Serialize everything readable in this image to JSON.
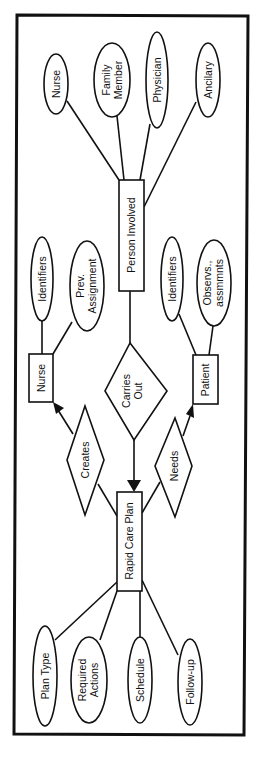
{
  "diagram": {
    "type": "entity-relationship",
    "orientation": "rotated-90-ccw",
    "colors": {
      "ink": "#111111",
      "background": "#ffffff"
    },
    "entities": [
      {
        "id": "person_involved",
        "label": "Person Involved"
      },
      {
        "id": "nurse",
        "label": "Nurse"
      },
      {
        "id": "patient",
        "label": "Patient"
      },
      {
        "id": "rapid_care_plan",
        "label": "Rapid Care Plan"
      }
    ],
    "relationships": [
      {
        "id": "carries_out",
        "lines": [
          "Carries",
          "Out"
        ],
        "from": "person_involved",
        "to": "rapid_care_plan"
      },
      {
        "id": "creates",
        "lines": [
          "Creates"
        ],
        "from": "rapid_care_plan",
        "to": "nurse"
      },
      {
        "id": "needs",
        "lines": [
          "Needs"
        ],
        "from": "rapid_care_plan",
        "to": "patient"
      }
    ],
    "attributes": {
      "person_involved": [
        {
          "id": "pi_nurse",
          "lines": [
            "Nurse"
          ]
        },
        {
          "id": "pi_family",
          "lines": [
            "Family",
            "Member"
          ]
        },
        {
          "id": "pi_physician",
          "lines": [
            "Physician"
          ]
        },
        {
          "id": "pi_ancilary",
          "lines": [
            "Ancilary"
          ]
        }
      ],
      "nurse": [
        {
          "id": "n_identifiers",
          "lines": [
            "Identifiers"
          ]
        },
        {
          "id": "n_prev",
          "lines": [
            "Prev.",
            "Assignment"
          ]
        }
      ],
      "patient": [
        {
          "id": "p_identifiers",
          "lines": [
            "Identifiers"
          ]
        },
        {
          "id": "p_observs",
          "lines": [
            "Observs.,",
            "assmmnts"
          ]
        }
      ],
      "rapid_care_plan": [
        {
          "id": "r_plantype",
          "lines": [
            "Plan Type"
          ]
        },
        {
          "id": "r_required",
          "lines": [
            "Required",
            "Actions"
          ]
        },
        {
          "id": "r_schedule",
          "lines": [
            "Schedule"
          ]
        },
        {
          "id": "r_followup",
          "lines": [
            "Follow-up"
          ]
        }
      ]
    }
  }
}
